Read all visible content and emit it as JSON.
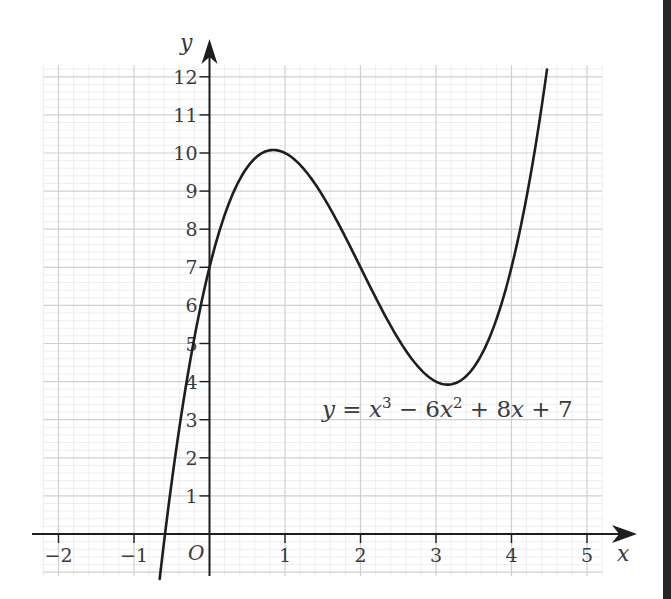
{
  "chart_data": {
    "type": "line",
    "title": "",
    "equation_label": {
      "lhs": "y",
      "eq": " = ",
      "t1": "x",
      "t1_exp": "3",
      "op1": " − 6",
      "t2": "x",
      "t2_exp": "2",
      "rest_a": " + 8",
      "t3": "x",
      "rest_b": " + 7"
    },
    "function": "y = x^3 - 6x^2 + 8x + 7",
    "coefficients": [
      1,
      -6,
      8,
      7
    ],
    "x_domain": [
      -0.66,
      4.47
    ],
    "xlabel": "x",
    "ylabel": "y",
    "origin_label": "O",
    "xlim": [
      -2.2,
      5.2
    ],
    "ylim": [
      -1.1,
      12.3
    ],
    "x_ticks": [
      -2,
      -1,
      1,
      2,
      3,
      4,
      5
    ],
    "x_tick_labels": [
      "−2",
      "−1",
      "1",
      "2",
      "3",
      "4",
      "5"
    ],
    "y_ticks": [
      1,
      2,
      3,
      4,
      5,
      6,
      7,
      8,
      9,
      10,
      11,
      12
    ],
    "y_tick_labels": [
      "1",
      "2",
      "3",
      "4",
      "5",
      "6",
      "7",
      "8",
      "9",
      "10",
      "11",
      "12"
    ],
    "grid": true,
    "grid_minor_step": 0.2,
    "grid_major_step": 1,
    "key_points": [
      {
        "label": "y-intercept",
        "x": 0,
        "y": 7
      },
      {
        "label": "local maximum",
        "x": 0.85,
        "y": 10.08
      },
      {
        "label": "local minimum",
        "x": 3.15,
        "y": 3.92
      }
    ],
    "sample_points": {
      "x": [
        -0.6,
        -0.5,
        0,
        0.5,
        1,
        1.5,
        2,
        2.5,
        3,
        3.5,
        4,
        4.4
      ],
      "y": [
        -0.18,
        1.38,
        7,
        9.63,
        10,
        8.88,
        7,
        5.13,
        4,
        4.38,
        7,
        11.22
      ]
    },
    "legend": null,
    "colors": {
      "curve": "#1e1e1e",
      "axes": "#1e1e1e",
      "grid_minor": "#e6e6e6",
      "grid_major": "#cfcfcf",
      "text": "#3a3a3a"
    }
  }
}
